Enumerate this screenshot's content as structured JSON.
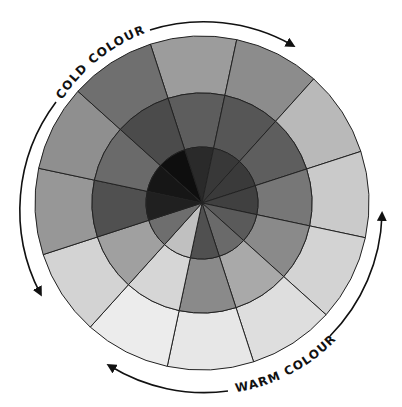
{
  "diagram": {
    "type": "colour-wheel",
    "center": [
      202,
      203
    ],
    "rings": {
      "outer_radius": 167,
      "middle_radius": 110,
      "inner_radius": 56
    },
    "segment_count": 12,
    "rotation_deg": -3,
    "outer_ring_colors": [
      "#9c9c9c",
      "#8c8c8c",
      "#b9b9b9",
      "#cacaca",
      "#d3d3d3",
      "#dedede",
      "#e7e7e7",
      "#ececec",
      "#d3d3d3",
      "#979797",
      "#8f8f8f",
      "#6f6f6f"
    ],
    "middle_ring_colors": [
      "#5d5d5d",
      "#565656",
      "#5e5e5e",
      "#777777",
      "#8a8a8a",
      "#a9a9a9",
      "#8a8a8a",
      "#d6d6d6",
      "#a0a0a0",
      "#505050",
      "#6a6a6a",
      "#4b4b4b"
    ],
    "inner_ring_colors": [
      "#2a2a2a",
      "#383838",
      "#3a3a3a",
      "#404040",
      "#5a5a5a",
      "#6a6a6a",
      "#505050",
      "#c0c0c0",
      "#6e6e6e",
      "#202020",
      "#161616",
      "#0e0e0e"
    ],
    "line_color": "#222222"
  },
  "labels": {
    "cold": "COLD COLOURS",
    "warm": "WARM COLOURS"
  },
  "arrows": {
    "cold_clockwise": "arrow-cold-clockwise",
    "cold_counterclockwise": "arrow-cold-counterclockwise",
    "warm_clockwise": "arrow-warm-up",
    "warm_counterclockwise": "arrow-warm-left"
  }
}
